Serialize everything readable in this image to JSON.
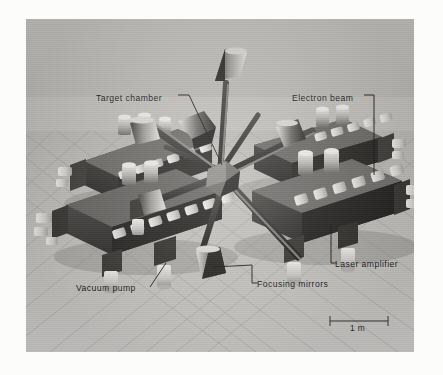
{
  "figure": {
    "kind": "photograph-of-scale-model",
    "background_color": "#fcfcfa",
    "photo_tone_color": "#bdbcb8",
    "ink_color": "#111111"
  },
  "callouts": [
    {
      "id": "target-chamber",
      "label": "Target chamber",
      "x": 96,
      "y": 93,
      "leader": "diagonal-down-right"
    },
    {
      "id": "electron-beam",
      "label": "Electron beam",
      "x": 292,
      "y": 93,
      "leader": "corner-down"
    },
    {
      "id": "laser-amplifier",
      "label": "Laser amplifier",
      "x": 333,
      "y": 261,
      "leader": "corner-up"
    },
    {
      "id": "focusing-mirrors",
      "label": "Focusing mirrors",
      "x": 253,
      "y": 281,
      "leader": "corner-up"
    },
    {
      "id": "vacuum-pump",
      "label": "Vacuum pump",
      "x": 76,
      "y": 283,
      "leader": "up-right"
    }
  ],
  "scale_bar": {
    "label": "1 m",
    "x": 330,
    "y": 320,
    "length_px": 58
  }
}
